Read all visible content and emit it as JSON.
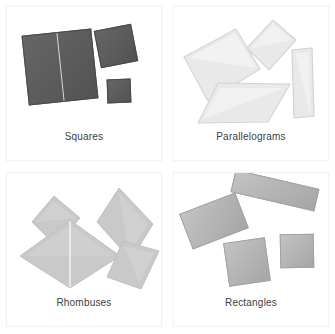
{
  "figure": {
    "background_color": "#ffffff",
    "panel_border_color": "#f2f2f2",
    "layout": "2x2 grid of labeled shape panels"
  },
  "panels": [
    {
      "id": "squares",
      "label": "Squares",
      "fill_color": "#5c5c5c",
      "shape_count": 3,
      "position": "top-left"
    },
    {
      "id": "parallelograms",
      "label": "Parallelograms",
      "fill_color": "#e9e9e9",
      "shape_count": 4,
      "position": "top-right"
    },
    {
      "id": "rhombuses",
      "label": "Rhombuses",
      "fill_color": "#c9c9c9",
      "shape_count": 4,
      "position": "bottom-left"
    },
    {
      "id": "rectangles",
      "label": "Rectangles",
      "fill_color": "#b2b2b2",
      "shape_count": 4,
      "position": "bottom-right"
    }
  ]
}
